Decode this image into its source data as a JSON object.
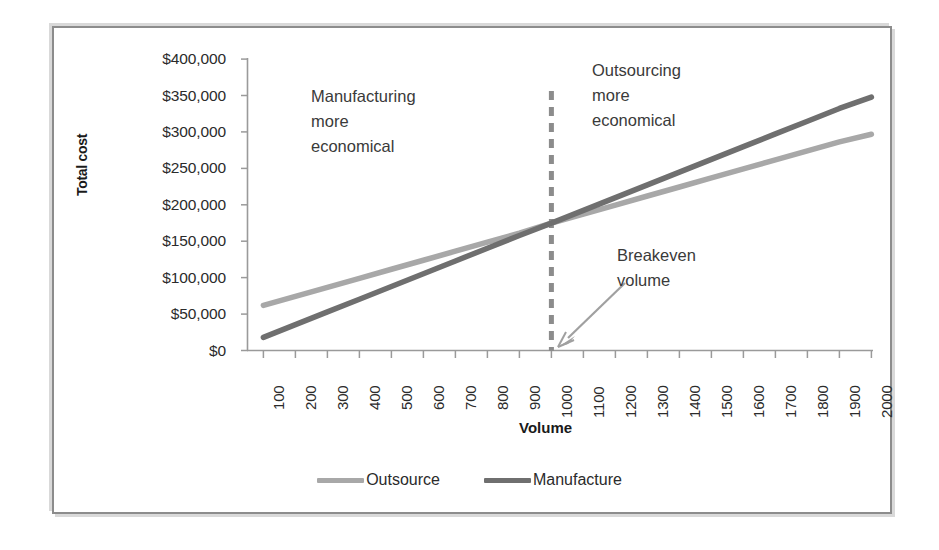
{
  "chart_data": {
    "type": "line",
    "title": "",
    "xlabel": "Volume",
    "ylabel": "Total cost",
    "xlim": [
      0,
      2000
    ],
    "ylim": [
      0,
      400000
    ],
    "grid": false,
    "legend_position": "bottom",
    "x": [
      100,
      200,
      300,
      400,
      500,
      600,
      700,
      800,
      900,
      1000,
      1100,
      1200,
      1300,
      1400,
      1500,
      1600,
      1700,
      1800,
      1900,
      2000
    ],
    "xticklabels": [
      "100",
      "200",
      "300",
      "400",
      "500",
      "600",
      "700",
      "800",
      "900",
      "1000",
      "1100",
      "1200",
      "1300",
      "1400",
      "1500",
      "1600",
      "1700",
      "1800",
      "1900",
      "2000"
    ],
    "yticks": [
      0,
      50000,
      100000,
      150000,
      200000,
      250000,
      300000,
      350000,
      400000
    ],
    "yticklabels": [
      "$0",
      "$50,000",
      "$100,000",
      "$150,000",
      "$200,000",
      "$250,000",
      "$300,000",
      "$350,000",
      "$400,000"
    ],
    "series": [
      {
        "name": "Outsource",
        "color": "#a8a8a8",
        "values": [
          62000,
          74400,
          86800,
          99200,
          111600,
          124000,
          136400,
          148800,
          161200,
          175000,
          187400,
          199800,
          212200,
          224600,
          237000,
          249400,
          261800,
          274200,
          286600,
          297000
        ]
      },
      {
        "name": "Manufacture",
        "color": "#6f6f6f",
        "values": [
          18000,
          35500,
          53000,
          70500,
          88000,
          105500,
          123000,
          140500,
          158000,
          175000,
          192500,
          210000,
          227500,
          245000,
          262500,
          280000,
          297500,
          315000,
          332500,
          348000
        ]
      }
    ],
    "annotations": [
      {
        "id": "manufacturing",
        "lines": [
          "Manufacturing",
          "more",
          "economical"
        ]
      },
      {
        "id": "outsourcing",
        "lines": [
          "Outsourcing",
          "more",
          "economical"
        ]
      },
      {
        "id": "breakeven",
        "lines": [
          "Breakeven",
          "volume"
        ]
      }
    ],
    "breakeven": {
      "volume": 1000,
      "cost": 175000,
      "line_color": "#8c8c8c",
      "line_style": "dashed"
    },
    "axis_color": "#9a9a9a",
    "frame_color": "#8c8c8c"
  },
  "legend": {
    "items": [
      {
        "label": "Outsource",
        "color": "#a8a8a8"
      },
      {
        "label": "Manufacture",
        "color": "#6f6f6f"
      }
    ]
  },
  "yticklabels": {
    "t0": "$0",
    "t1": "$50,000",
    "t2": "$100,000",
    "t3": "$150,000",
    "t4": "$200,000",
    "t5": "$250,000",
    "t6": "$300,000",
    "t7": "$350,000",
    "t8": "$400,000"
  },
  "xticklabels": {
    "t0": "100",
    "t1": "200",
    "t2": "300",
    "t3": "400",
    "t4": "500",
    "t5": "600",
    "t6": "700",
    "t7": "800",
    "t8": "900",
    "t9": "1000",
    "t10": "1100",
    "t11": "1200",
    "t12": "1300",
    "t13": "1400",
    "t14": "1500",
    "t15": "1600",
    "t16": "1700",
    "t17": "1800",
    "t18": "1900",
    "t19": "2000"
  },
  "axis_titles": {
    "y": "Total cost",
    "x": "Volume"
  },
  "annotations": {
    "manufacturing": {
      "line1": "Manufacturing",
      "line2": "more",
      "line3": "economical"
    },
    "outsourcing": {
      "line1": "Outsourcing",
      "line2": "more",
      "line3": "economical"
    },
    "breakeven": {
      "line1": "Breakeven",
      "line2": "volume"
    }
  }
}
